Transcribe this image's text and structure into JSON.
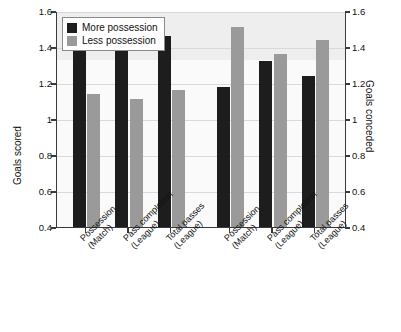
{
  "chart_data": {
    "type": "bar",
    "title": "",
    "subtitle": "",
    "xlabel": "",
    "ylabel": "Goals scored",
    "y2label": "Goals conceded",
    "ylim": [
      0.4,
      1.6
    ],
    "y2lim": [
      0.4,
      1.6
    ],
    "yticks": [
      "0.4",
      "0.6",
      "0.8",
      "1",
      "1.2",
      "1.4",
      "1.6"
    ],
    "ytick_values": [
      0.4,
      0.6,
      0.8,
      1.0,
      1.2,
      1.4,
      1.6
    ],
    "y2ticks": [
      "0.4",
      "0.6",
      "0.8",
      "1",
      "1.2",
      "1.4",
      "1.6"
    ],
    "grid": true,
    "legend_position": "top-left",
    "groups": [
      {
        "name": "Goals scored",
        "axis": "left",
        "categories": [
          {
            "line1": "Possession",
            "line2": "(Match)"
          },
          {
            "line1": "Pass completion",
            "line2": "(League)"
          },
          {
            "line1": "Total passes",
            "line2": "(League)"
          }
        ]
      },
      {
        "name": "Goals conceded",
        "axis": "right",
        "categories": [
          {
            "line1": "Possession",
            "line2": "(Match)"
          },
          {
            "line1": "Pass completion",
            "line2": "(League)"
          },
          {
            "line1": "Total passes",
            "line2": "(League)"
          }
        ]
      }
    ],
    "categories": [
      "Possession (Match)",
      "Pass completion (League)",
      "Total passes (League)",
      "Possession (Match)",
      "Pass completion (League)",
      "Total passes (League)"
    ],
    "series": [
      {
        "name": "More possession",
        "color": "#1d1d1d",
        "values": [
          1.44,
          1.45,
          1.46,
          1.18,
          1.32,
          1.24
        ]
      },
      {
        "name": "Less possession",
        "color": "#9a9a9a",
        "values": [
          1.14,
          1.11,
          1.16,
          1.51,
          1.36,
          1.44
        ]
      }
    ]
  },
  "legend": {
    "items": [
      {
        "label": "More possession",
        "color": "#1d1d1d"
      },
      {
        "label": "Less possession",
        "color": "#9a9a9a"
      }
    ]
  },
  "axes": {
    "left_title": "Goals scored",
    "right_title": "Goals conceded"
  }
}
